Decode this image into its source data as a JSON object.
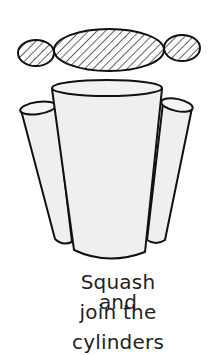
{
  "diagram": {
    "type": "illustration",
    "shapes": {
      "hatched_ellipses": [
        "left-small",
        "center-large",
        "right-small"
      ],
      "cylinders": [
        "left-thin",
        "center-large",
        "right-thin"
      ]
    },
    "colors": {
      "outline": "#111111",
      "fill": "#efefef",
      "hatch": "#111111",
      "background": "#ffffff"
    }
  },
  "caption": {
    "line1": "Squash and",
    "line2": "join the",
    "line3": "cylinders"
  }
}
